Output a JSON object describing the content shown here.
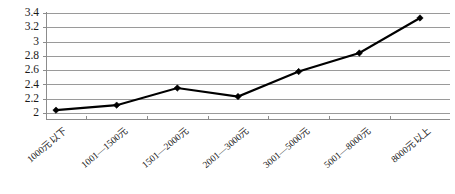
{
  "chart_data": {
    "type": "line",
    "title": "",
    "subtitle": "",
    "xlabel": "",
    "ylabel": "",
    "categories": [
      "1000元以下",
      "1001—1500元",
      "1501—2000元",
      "2001—3000元",
      "3001—5000元",
      "5001—8000元",
      "8000元以上"
    ],
    "values": [
      2.04,
      2.11,
      2.35,
      2.23,
      2.58,
      2.84,
      3.33
    ],
    "series": [
      {
        "name": "",
        "values": [
          2.04,
          2.11,
          2.35,
          2.23,
          2.58,
          2.84,
          3.33
        ]
      }
    ],
    "ylim": [
      2,
      3.4
    ],
    "ytick_labels": [
      "2",
      "2.2",
      "2.4",
      "2.6",
      "2.8",
      "3",
      "3.2",
      "3.4"
    ],
    "ytick_values": [
      2,
      2.2,
      2.4,
      2.6,
      2.8,
      3,
      3.2,
      3.4
    ],
    "grid": true,
    "grid_orientation": "horizontal",
    "legend": false,
    "legend_position": "none",
    "marker": "diamond",
    "xlabel_rotation_deg": -40,
    "colors": {
      "line": "#000000",
      "marker": "#000000",
      "gridline": "#9a9a9a",
      "axis": "#8c8c8c",
      "text": "#1a1a1a",
      "background": "#ffffff"
    }
  }
}
